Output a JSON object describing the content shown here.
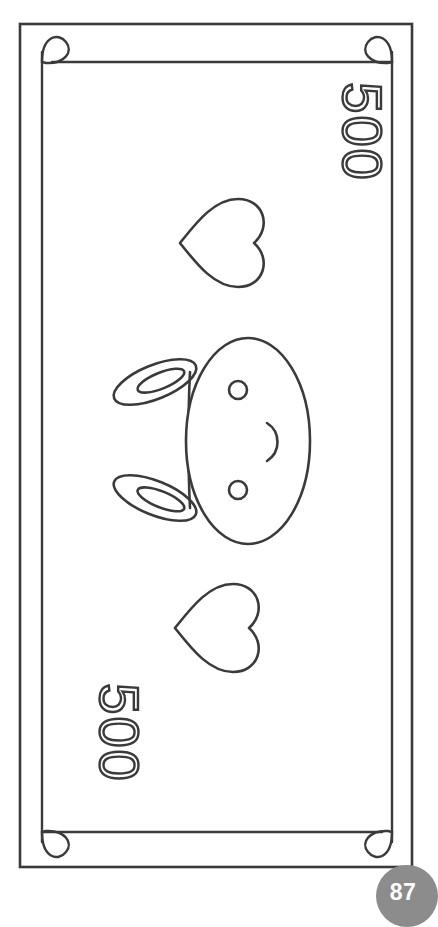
{
  "page": {
    "kind": "coloring-book-page",
    "page_number": "87",
    "background_color": "#ffffff",
    "ink_color": "#3a3a3a",
    "badge_color": "#8c8c8c",
    "badge_text_color": "#ffffff",
    "orientation_note": "artwork rotated 90 degrees"
  },
  "banknote": {
    "outer_frame": {
      "name": "outer-frame",
      "stroke": "#3a3a3a"
    },
    "inner_frame": {
      "name": "inner-frame",
      "stroke": "#3a3a3a"
    },
    "denominations": [
      {
        "id": "top-right",
        "value": "500"
      },
      {
        "id": "bottom-left",
        "value": "500"
      }
    ],
    "hearts": [
      {
        "id": "heart-upper"
      },
      {
        "id": "heart-lower"
      }
    ],
    "face": {
      "name": "bunny-face",
      "parts": [
        "head-oval",
        "ear-upper",
        "ear-lower",
        "eye-upper",
        "eye-lower",
        "mouth"
      ]
    },
    "corner_flourishes": [
      {
        "id": "corner-top-left"
      },
      {
        "id": "corner-top-right"
      },
      {
        "id": "corner-bottom-left"
      },
      {
        "id": "corner-bottom-right"
      }
    ]
  }
}
